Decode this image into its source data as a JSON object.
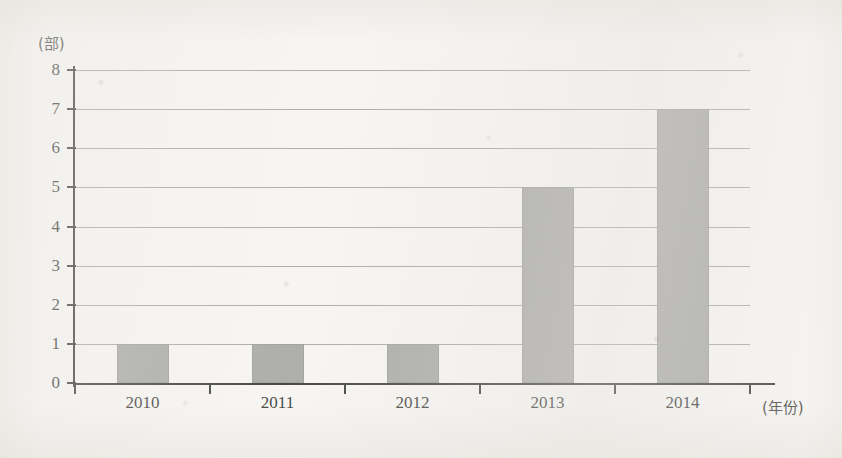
{
  "chart_data": {
    "type": "bar",
    "title": "",
    "subtitle": "",
    "xlabel": "(年份)",
    "ylabel": "(部)",
    "categories": [
      "2010",
      "2011",
      "2012",
      "2013",
      "2014"
    ],
    "values": [
      1,
      1,
      1,
      5,
      7
    ],
    "series": [
      {
        "name": "",
        "values": [
          1,
          1,
          1,
          5,
          7
        ]
      }
    ],
    "ylim": [
      0,
      8
    ],
    "y_ticks": [
      "8",
      "7",
      "6",
      "5",
      "4",
      "3",
      "2",
      "1",
      "0"
    ],
    "y_tick_values": [
      8,
      7,
      6,
      5,
      4,
      3,
      2,
      1,
      0
    ],
    "x_ticks": [
      "2010",
      "2011",
      "2012",
      "2013",
      "2014"
    ],
    "grid": true,
    "grid_axis": "y",
    "legend": false,
    "legend_position": "none",
    "bar_color": "#9d9d9b",
    "axis_color": "#20201f",
    "grid_color": "#8d8d8a",
    "background_color": "#f6f5f2",
    "annotations": []
  },
  "axes": {
    "y_unit": "(部)",
    "x_unit": "(年份)"
  }
}
